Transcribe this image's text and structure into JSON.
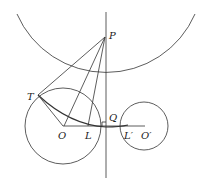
{
  "diagram": {
    "type": "geometry",
    "labels": {
      "P": "P",
      "T": "T",
      "O": "O",
      "L": "L",
      "Q": "Q",
      "L_prime": "L′",
      "O_prime": "O′"
    },
    "colors": {
      "stroke": "#333333",
      "background": "#ffffff"
    }
  }
}
